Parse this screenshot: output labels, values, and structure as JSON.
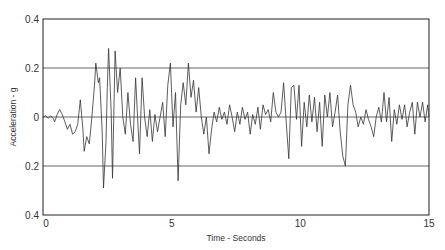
{
  "chart_data": {
    "type": "line",
    "title": "",
    "xlabel": "Time - Seconds",
    "ylabel": "Acceleration - g",
    "xlim": [
      0,
      15
    ],
    "ylim": [
      -0.4,
      0.4
    ],
    "x_ticks": [
      0,
      5,
      10,
      15
    ],
    "x_tick_labels": [
      "0",
      "5",
      "10",
      "15"
    ],
    "y_ticks": [
      0.4,
      0.2,
      0,
      -0.2,
      -0.4
    ],
    "y_tick_labels": [
      "0.4",
      "0.2",
      "0",
      "0.2",
      "0.4"
    ],
    "grid": {
      "horizontal": [
        0.2,
        0,
        -0.2
      ],
      "vertical": false
    },
    "legend": null,
    "series": [
      {
        "name": "Ground acceleration record",
        "points": [
          [
            0.0,
            0.0
          ],
          [
            0.1,
            0.005
          ],
          [
            0.2,
            -0.005
          ],
          [
            0.3,
            0.004
          ],
          [
            0.4,
            -0.006
          ],
          [
            0.45,
            -0.02
          ],
          [
            0.55,
            0.01
          ],
          [
            0.65,
            0.03
          ],
          [
            0.75,
            0.01
          ],
          [
            0.85,
            -0.02
          ],
          [
            0.95,
            -0.05
          ],
          [
            1.05,
            -0.03
          ],
          [
            1.15,
            -0.07
          ],
          [
            1.25,
            -0.06
          ],
          [
            1.35,
            -0.03
          ],
          [
            1.45,
            0.07
          ],
          [
            1.55,
            -0.05
          ],
          [
            1.6,
            -0.14
          ],
          [
            1.7,
            -0.08
          ],
          [
            1.8,
            -0.11
          ],
          [
            1.9,
            0.0
          ],
          [
            2.0,
            0.13
          ],
          [
            2.05,
            0.22
          ],
          [
            2.15,
            0.14
          ],
          [
            2.2,
            0.16
          ],
          [
            2.3,
            -0.06
          ],
          [
            2.35,
            -0.29
          ],
          [
            2.45,
            -0.1
          ],
          [
            2.5,
            0.12
          ],
          [
            2.55,
            0.28
          ],
          [
            2.65,
            0.02
          ],
          [
            2.7,
            -0.25
          ],
          [
            2.8,
            0.27
          ],
          [
            2.9,
            0.1
          ],
          [
            3.0,
            0.2
          ],
          [
            3.1,
            0.0
          ],
          [
            3.2,
            -0.07
          ],
          [
            3.3,
            0.1
          ],
          [
            3.4,
            -0.03
          ],
          [
            3.5,
            -0.1
          ],
          [
            3.6,
            0.16
          ],
          [
            3.7,
            -0.05
          ],
          [
            3.75,
            -0.15
          ],
          [
            3.85,
            0.16
          ],
          [
            3.95,
            0.0
          ],
          [
            4.05,
            -0.08
          ],
          [
            4.15,
            0.03
          ],
          [
            4.25,
            -0.1
          ],
          [
            4.35,
            0.01
          ],
          [
            4.45,
            -0.06
          ],
          [
            4.55,
            0.0
          ],
          [
            4.65,
            0.06
          ],
          [
            4.75,
            -0.08
          ],
          [
            4.85,
            0.13
          ],
          [
            4.95,
            0.22
          ],
          [
            5.05,
            -0.04
          ],
          [
            5.15,
            0.1
          ],
          [
            5.25,
            -0.26
          ],
          [
            5.35,
            0.05
          ],
          [
            5.45,
            0.14
          ],
          [
            5.55,
            0.05
          ],
          [
            5.65,
            0.22
          ],
          [
            5.75,
            0.08
          ],
          [
            5.85,
            0.15
          ],
          [
            5.95,
            0.02
          ],
          [
            6.05,
            0.12
          ],
          [
            6.15,
            0.0
          ],
          [
            6.25,
            -0.07
          ],
          [
            6.35,
            0.0
          ],
          [
            6.45,
            -0.15
          ],
          [
            6.55,
            -0.05
          ],
          [
            6.65,
            0.02
          ],
          [
            6.75,
            -0.02
          ],
          [
            6.85,
            0.04
          ],
          [
            6.95,
            -0.01
          ],
          [
            7.05,
            0.02
          ],
          [
            7.15,
            -0.03
          ],
          [
            7.25,
            0.05
          ],
          [
            7.35,
            0.0
          ],
          [
            7.45,
            -0.06
          ],
          [
            7.55,
            0.02
          ],
          [
            7.65,
            -0.03
          ],
          [
            7.75,
            0.04
          ],
          [
            7.85,
            -0.01
          ],
          [
            7.95,
            0.02
          ],
          [
            8.05,
            -0.07
          ],
          [
            8.15,
            0.01
          ],
          [
            8.25,
            -0.03
          ],
          [
            8.35,
            0.04
          ],
          [
            8.45,
            -0.05
          ],
          [
            8.55,
            0.05
          ],
          [
            8.65,
            0.01
          ],
          [
            8.75,
            0.03
          ],
          [
            8.85,
            -0.02
          ],
          [
            8.95,
            0.1
          ],
          [
            9.05,
            0.02
          ],
          [
            9.15,
            0.0
          ],
          [
            9.25,
            0.02
          ],
          [
            9.35,
            0.14
          ],
          [
            9.45,
            -0.02
          ],
          [
            9.55,
            -0.17
          ],
          [
            9.65,
            0.12
          ],
          [
            9.75,
            0.13
          ],
          [
            9.85,
            -0.01
          ],
          [
            9.95,
            0.13
          ],
          [
            10.05,
            -0.12
          ],
          [
            10.15,
            0.06
          ],
          [
            10.25,
            -0.04
          ],
          [
            10.35,
            0.09
          ],
          [
            10.45,
            -0.02
          ],
          [
            10.55,
            0.08
          ],
          [
            10.65,
            -0.06
          ],
          [
            10.75,
            0.06
          ],
          [
            10.85,
            -0.12
          ],
          [
            10.95,
            0.09
          ],
          [
            11.05,
            0.0
          ],
          [
            11.15,
            0.1
          ],
          [
            11.25,
            -0.04
          ],
          [
            11.35,
            0.02
          ],
          [
            11.45,
            0.09
          ],
          [
            11.55,
            -0.06
          ],
          [
            11.65,
            -0.16
          ],
          [
            11.75,
            -0.2
          ],
          [
            11.85,
            0.05
          ],
          [
            11.95,
            0.13
          ],
          [
            12.05,
            0.05
          ],
          [
            12.15,
            0.02
          ],
          [
            12.25,
            -0.04
          ],
          [
            12.35,
            0.0
          ],
          [
            12.45,
            -0.03
          ],
          [
            12.55,
            0.03
          ],
          [
            12.65,
            -0.01
          ],
          [
            12.75,
            -0.04
          ],
          [
            12.85,
            -0.08
          ],
          [
            12.95,
            0.0
          ],
          [
            13.05,
            0.04
          ],
          [
            13.15,
            -0.02
          ],
          [
            13.25,
            0.1
          ],
          [
            13.35,
            -0.02
          ],
          [
            13.45,
            0.08
          ],
          [
            13.55,
            -0.1
          ],
          [
            13.65,
            0.03
          ],
          [
            13.75,
            -0.03
          ],
          [
            13.85,
            0.05
          ],
          [
            13.95,
            -0.01
          ],
          [
            14.05,
            0.05
          ],
          [
            14.15,
            -0.04
          ],
          [
            14.25,
            0.02
          ],
          [
            14.35,
            0.06
          ],
          [
            14.45,
            -0.07
          ],
          [
            14.55,
            0.06
          ],
          [
            14.65,
            0.0
          ],
          [
            14.75,
            0.06
          ],
          [
            14.85,
            -0.02
          ],
          [
            14.95,
            0.05
          ],
          [
            15.0,
            0.0
          ]
        ]
      }
    ],
    "annotations": []
  },
  "layout": {
    "plot_px": {
      "left": 43,
      "right": 429,
      "top": 19,
      "bottom": 215
    },
    "colors": {
      "line": "#333333",
      "grid": "#555555",
      "background": "#ffffff"
    }
  }
}
